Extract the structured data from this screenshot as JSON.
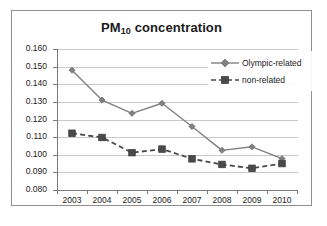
{
  "chart_data": {
    "type": "line",
    "title": "PM10 concentration",
    "title_base": "PM",
    "title_sub": "10",
    "title_rest": " concentration",
    "xlabel": "",
    "ylabel": "",
    "categories": [
      "2003",
      "2004",
      "2005",
      "2006",
      "2007",
      "2008",
      "2009",
      "2010"
    ],
    "ylim": [
      0.08,
      0.16
    ],
    "ytick_labels": [
      "0.160",
      "0.150",
      "0.140",
      "0.130",
      "0.120",
      "0.110",
      "0.100",
      "0.090",
      "0.080"
    ],
    "ytick_values": [
      0.16,
      0.15,
      0.14,
      0.13,
      0.12,
      0.11,
      0.1,
      0.09,
      0.08
    ],
    "grid": true,
    "legend_position": "top-right",
    "series": [
      {
        "name": "Olympic-related",
        "marker": "diamond",
        "line_style": "solid",
        "color": "#808080",
        "values": [
          0.148,
          0.131,
          0.1235,
          0.1292,
          0.116,
          0.1025,
          0.1045,
          0.0978
        ]
      },
      {
        "name": "non-related",
        "marker": "square",
        "line_style": "dashed",
        "color": "#4a4a4a",
        "values": [
          0.1122,
          0.1098,
          0.1012,
          0.1032,
          0.0977,
          0.0945,
          0.0923,
          0.095
        ]
      }
    ]
  },
  "colors": {
    "axis": "#7a7a7a",
    "grid": "#c9c9c9",
    "frame": "#8f8f8f",
    "text": "#1a1a1a",
    "series_1": "#808080",
    "series_2": "#4a4a4a",
    "background": "#ffffff"
  }
}
